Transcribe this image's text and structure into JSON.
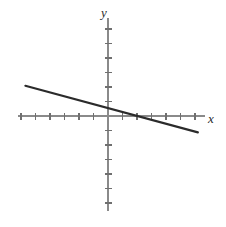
{
  "figure": {
    "title": "",
    "background_color": "#ffffff",
    "width": 226,
    "height": 227
  },
  "labels": {
    "x_axis": "x",
    "y_axis": "y"
  },
  "colors": {
    "axis": "#8a8a8a",
    "tick": "#6f6f6f",
    "line": "#2b2b2b",
    "background": "#ffffff"
  },
  "geometry": {
    "origin_x": 108,
    "origin_y": 116,
    "unit_px": 14.5,
    "x_axis_start_px": 18,
    "x_axis_end_px": 205,
    "y_axis_top_px": 18,
    "y_axis_bottom_px": 211,
    "tick_half_len": 3.5,
    "x_label_pos": [
      211,
      120
    ],
    "y_label_pos": [
      104,
      14
    ]
  },
  "chart_data": {
    "type": "line",
    "title": "",
    "xlabel": "x",
    "ylabel": "y",
    "grid": false,
    "legend": false,
    "xlim": [
      -6.2,
      6.7
    ],
    "ylim": [
      -6.8,
      6.8
    ],
    "x_ticks": [
      -6,
      -5,
      -4,
      -3,
      -2,
      -1,
      1,
      2,
      3,
      4,
      5,
      6
    ],
    "y_ticks": [
      -6,
      -5,
      -4,
      -3,
      -2,
      -1,
      1,
      2,
      3,
      4,
      5,
      6
    ],
    "x_tick_labels": [],
    "y_tick_labels": [],
    "series": [
      {
        "name": "line",
        "slope": -0.27,
        "intercept": 0.54,
        "x_intercept": 2.0,
        "y_intercept": 0.54,
        "x": [
          -5.7,
          6.2
        ],
        "y": [
          2.08,
          -1.13
        ],
        "equation": "y = -0.27x + 0.54"
      }
    ]
  }
}
